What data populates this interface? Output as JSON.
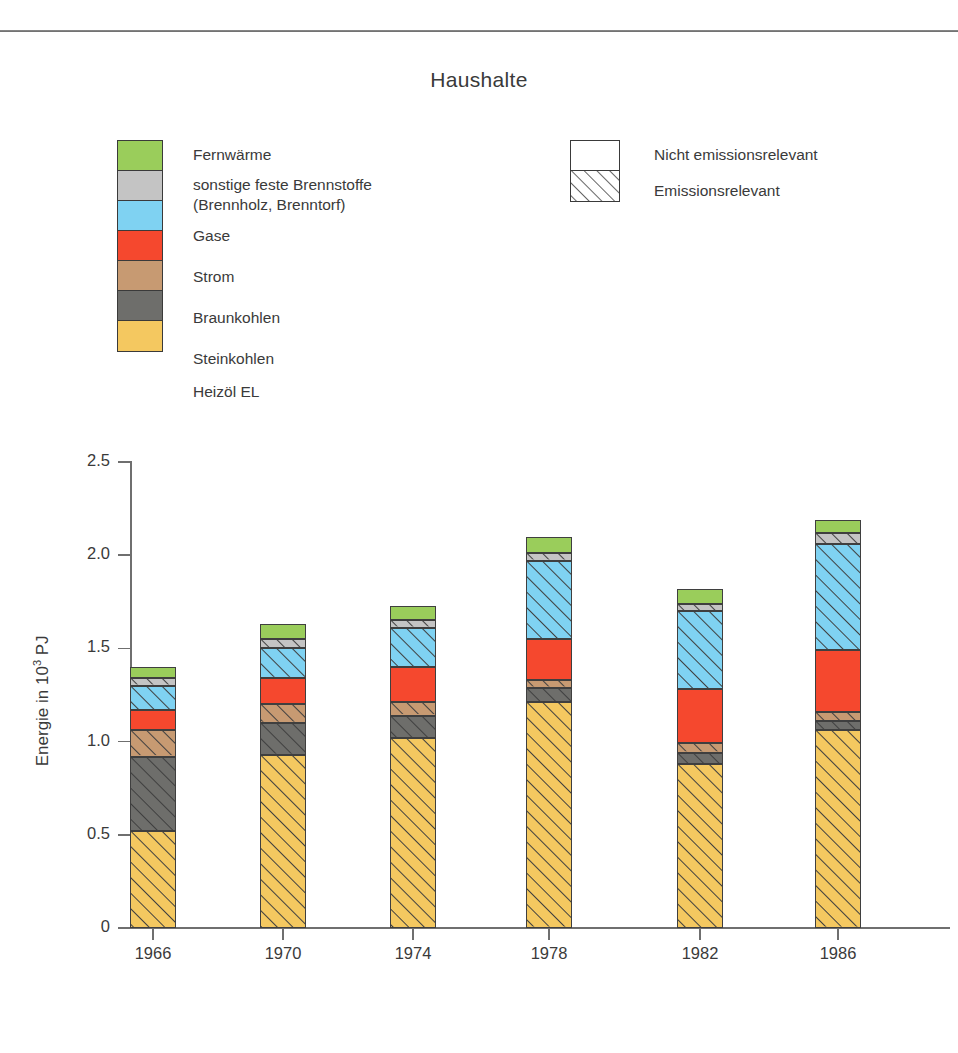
{
  "chart_title": "Haushalte",
  "legend_fuels": {
    "items": [
      {
        "label": "Fernwärme",
        "color": "#9ACD5B",
        "hatched": false
      },
      {
        "label": "sonstige feste Brennstoffe\n(Brennholz, Brenntorf)",
        "color": "#C4C4C4",
        "hatched": true
      },
      {
        "label": "Gase",
        "color": "#7FD2F2",
        "hatched": true
      },
      {
        "label": "Strom",
        "color": "#F5482E",
        "hatched": false
      },
      {
        "label": "Braunkohlen",
        "color": "#C79A72",
        "hatched": true
      },
      {
        "label": "Steinkohlen",
        "color": "#6E6E6B",
        "hatched": true
      },
      {
        "label": "Heizöl EL",
        "color": "#F4C860",
        "hatched": true
      }
    ],
    "line1_label": "Fernwärme",
    "line2_label": "sonstige feste Brennstoffe",
    "line3_label": "(Brennholz, Brenntorf)",
    "line4_label": "Gase",
    "line5_label": "Strom",
    "line6_label": "Braunkohlen",
    "line7_label": "Steinkohlen",
    "line8_label": "Heizöl EL"
  },
  "legend_emission": {
    "not_relevant_label": "Nicht emissionsrelevant",
    "relevant_label": "Emissionsrelevant"
  },
  "chart_data": {
    "type": "bar",
    "subtype": "stacked",
    "title": "Haushalte",
    "xlabel": "",
    "ylabel": "Energie in 10³ PJ",
    "ylabel_prefix": "Energie in 10",
    "ylabel_exp": "3",
    "ylabel_suffix": " PJ",
    "ylim": [
      0,
      2.5
    ],
    "yticks": [
      "0",
      "0.5",
      "1.0",
      "1.5",
      "2.0",
      "2.5"
    ],
    "ytick_values": [
      0,
      0.5,
      1.0,
      1.5,
      2.0,
      2.5
    ],
    "grid": false,
    "legend_position": "top",
    "categories": [
      "1966",
      "1970",
      "1974",
      "1978",
      "1982",
      "1986"
    ],
    "stack_order_bottom_to_top": [
      "Heizöl EL",
      "Steinkohlen",
      "Braunkohlen",
      "Strom",
      "Gase",
      "sonstige feste Brennstoffe",
      "Fernwärme"
    ],
    "series": [
      {
        "name": "Heizöl EL",
        "color": "#F4C860",
        "hatched": true,
        "values": [
          0.52,
          0.93,
          1.02,
          1.21,
          0.88,
          1.06
        ]
      },
      {
        "name": "Steinkohlen",
        "color": "#6E6E6B",
        "hatched": true,
        "values": [
          0.4,
          0.17,
          0.12,
          0.08,
          0.06,
          0.05
        ]
      },
      {
        "name": "Braunkohlen",
        "color": "#C79A72",
        "hatched": true,
        "values": [
          0.14,
          0.1,
          0.07,
          0.04,
          0.05,
          0.05
        ]
      },
      {
        "name": "Strom",
        "color": "#F5482E",
        "hatched": false,
        "values": [
          0.11,
          0.14,
          0.19,
          0.22,
          0.29,
          0.33
        ]
      },
      {
        "name": "Gase",
        "color": "#7FD2F2",
        "hatched": true,
        "values": [
          0.13,
          0.16,
          0.21,
          0.42,
          0.42,
          0.57
        ]
      },
      {
        "name": "sonstige feste Brennstoffe",
        "color": "#C4C4C4",
        "hatched": true,
        "values": [
          0.04,
          0.05,
          0.04,
          0.04,
          0.04,
          0.06
        ]
      },
      {
        "name": "Fernwärme",
        "color": "#9ACD5B",
        "hatched": false,
        "values": [
          0.06,
          0.08,
          0.08,
          0.09,
          0.08,
          0.07
        ]
      }
    ],
    "totals": [
      1.43,
      1.81,
      1.82,
      2.1,
      1.85,
      2.19
    ]
  },
  "colors": {
    "fernwaerme": "#9ACD5B",
    "sonstige": "#C4C4C4",
    "gase": "#7FD2F2",
    "strom": "#F5482E",
    "braunkohlen": "#C79A72",
    "steinkohlen": "#6E6E6B",
    "heizoel": "#F4C860",
    "axis": "#6f6f6f",
    "text": "#3a3a3a"
  }
}
